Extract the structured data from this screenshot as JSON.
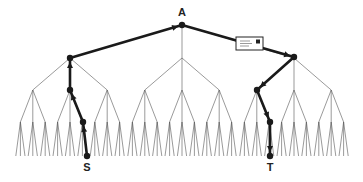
{
  "diagram": {
    "type": "tree",
    "branching_factor": 3,
    "colors": {
      "tree_lines": "#555555",
      "path": "#1a1a1a",
      "background": "#ffffff"
    },
    "labels": {
      "root": "A",
      "source": "S",
      "target": "T"
    },
    "geometry": {
      "root": [
        182,
        25
      ],
      "level_y": [
        25,
        58,
        90,
        122,
        156
      ],
      "level1_x": [
        70,
        182,
        294
      ],
      "level2_spacing": 37.2,
      "level3_spacing": 12.4,
      "leaf_spread": 4.6
    },
    "path_nodes": [
      [
        87,
        156
      ],
      [
        83,
        122
      ],
      [
        70,
        90
      ],
      [
        70,
        58
      ],
      [
        182,
        25
      ],
      [
        294,
        57
      ],
      [
        257,
        90
      ],
      [
        270,
        122
      ],
      [
        270,
        156
      ]
    ],
    "envelope": {
      "x": 236,
      "y": 37,
      "w": 27,
      "h": 13,
      "icon": "envelope-icon"
    },
    "label_positions": {
      "root": [
        182,
        7
      ],
      "source": [
        87,
        162
      ],
      "target": [
        270,
        162
      ]
    }
  }
}
